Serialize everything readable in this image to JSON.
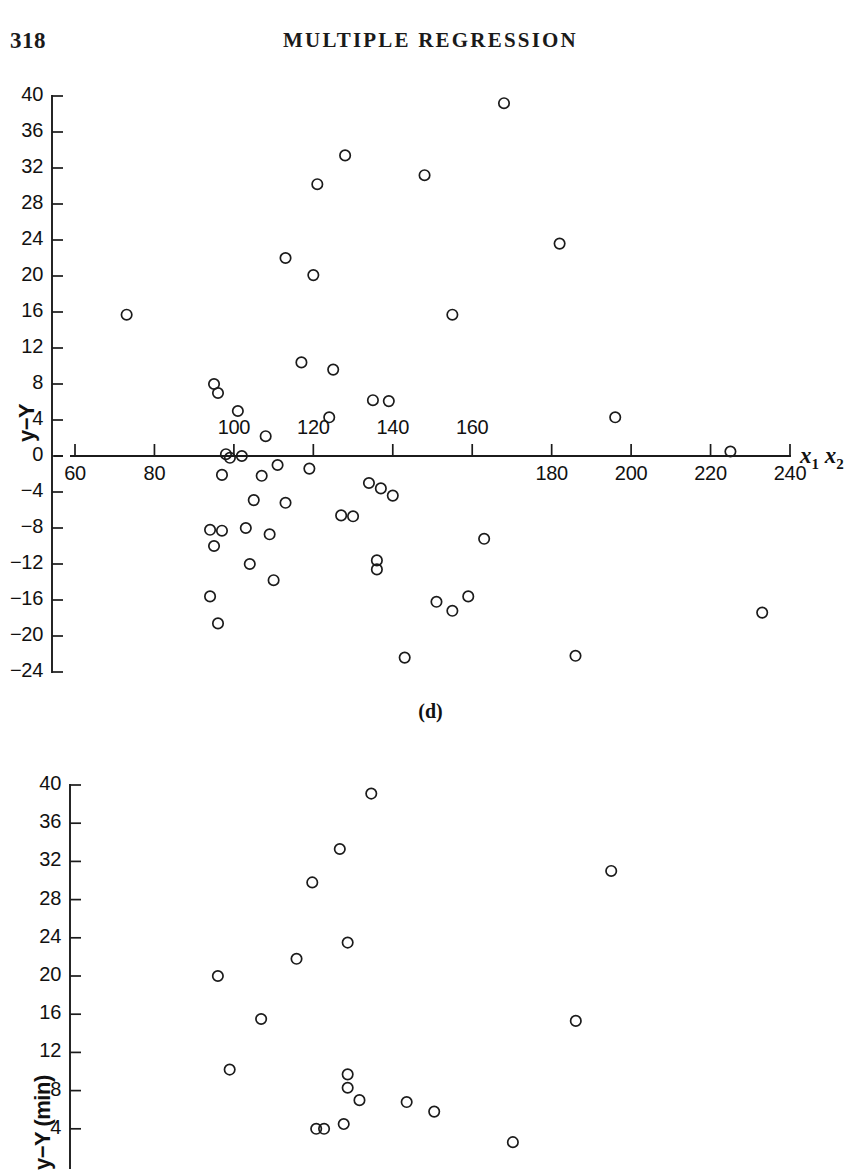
{
  "header": {
    "page_number": "318",
    "running_head": "MULTIPLE REGRESSION"
  },
  "figures": {
    "panel_d_caption": "(d)"
  },
  "chart_data": [
    {
      "id": "panel-d",
      "type": "scatter",
      "title": "",
      "caption": "(d)",
      "xlabel": "x₁x₂",
      "ylabel": "y−Y",
      "xlim": [
        52,
        248
      ],
      "ylim": [
        -24,
        40
      ],
      "grid": false,
      "legend": "none",
      "axis_origin_y": 0,
      "x_ticks": [
        60,
        80,
        100,
        120,
        140,
        160,
        180,
        200,
        220,
        240
      ],
      "x_tick_labels": [
        "60",
        "80",
        "100",
        "120",
        "140",
        "160",
        "180",
        "200",
        "220",
        "240"
      ],
      "x_labels_above_axis": [
        "100",
        "120",
        "140",
        "160"
      ],
      "x_labels_below_axis": [
        "60",
        "80",
        "180",
        "200",
        "220",
        "240"
      ],
      "y_ticks": [
        40,
        36,
        32,
        28,
        24,
        20,
        16,
        12,
        8,
        4,
        0,
        -4,
        -8,
        -12,
        -16,
        -20,
        -24
      ],
      "y_tick_labels": [
        "40",
        "36",
        "32",
        "28",
        "24",
        "20",
        "16",
        "12",
        "8",
        "4",
        "0",
        "−4",
        "−8",
        "−12",
        "−16",
        "−20",
        "−24"
      ],
      "points": [
        [
          168,
          39.2
        ],
        [
          128,
          33.4
        ],
        [
          148,
          31.2
        ],
        [
          121,
          30.2
        ],
        [
          182,
          23.6
        ],
        [
          113,
          22.0
        ],
        [
          120,
          20.1
        ],
        [
          73,
          15.7
        ],
        [
          155,
          15.7
        ],
        [
          117,
          10.4
        ],
        [
          125,
          9.6
        ],
        [
          95,
          8.0
        ],
        [
          96,
          7.0
        ],
        [
          135,
          6.2
        ],
        [
          139,
          6.1
        ],
        [
          101,
          5.0
        ],
        [
          196,
          4.3
        ],
        [
          124,
          4.3
        ],
        [
          108,
          2.2
        ],
        [
          225,
          0.5
        ],
        [
          98,
          0.2
        ],
        [
          102,
          0.0
        ],
        [
          99,
          -0.2
        ],
        [
          111,
          -1.0
        ],
        [
          119,
          -1.4
        ],
        [
          97,
          -2.1
        ],
        [
          107,
          -2.2
        ],
        [
          134,
          -3.0
        ],
        [
          137,
          -3.6
        ],
        [
          140,
          -4.4
        ],
        [
          105,
          -4.9
        ],
        [
          113,
          -5.2
        ],
        [
          127,
          -6.6
        ],
        [
          130,
          -6.7
        ],
        [
          103,
          -8.0
        ],
        [
          94,
          -8.2
        ],
        [
          97,
          -8.3
        ],
        [
          109,
          -8.7
        ],
        [
          95,
          -10.0
        ],
        [
          163,
          -9.2
        ],
        [
          104,
          -12.0
        ],
        [
          136,
          -11.6
        ],
        [
          136,
          -12.6
        ],
        [
          110,
          -13.8
        ],
        [
          94,
          -15.6
        ],
        [
          151,
          -16.2
        ],
        [
          159,
          -15.6
        ],
        [
          233,
          -17.4
        ],
        [
          96,
          -18.6
        ],
        [
          155,
          -17.2
        ],
        [
          143,
          -22.4
        ],
        [
          186,
          -22.2
        ]
      ]
    },
    {
      "id": "panel-e",
      "type": "scatter",
      "title": "",
      "caption": "",
      "xlabel": "",
      "ylabel": "y−Y (min)",
      "xlim": [
        52,
        248
      ],
      "ylim": [
        2,
        40
      ],
      "grid": false,
      "legend": "none",
      "y_ticks": [
        40,
        36,
        32,
        28,
        24,
        20,
        16,
        12,
        8,
        4
      ],
      "y_tick_labels": [
        "40",
        "36",
        "32",
        "28",
        "24",
        "20",
        "16",
        "12",
        "8",
        "4"
      ],
      "points": [
        [
          131,
          39.1
        ],
        [
          123,
          33.3
        ],
        [
          116,
          29.8
        ],
        [
          125,
          23.5
        ],
        [
          112,
          21.8
        ],
        [
          192,
          31.0
        ],
        [
          92,
          20.0
        ],
        [
          103,
          15.5
        ],
        [
          183,
          15.3
        ],
        [
          95,
          10.2
        ],
        [
          125,
          9.7
        ],
        [
          125,
          8.3
        ],
        [
          128,
          7.0
        ],
        [
          140,
          6.8
        ],
        [
          147,
          5.8
        ],
        [
          124,
          4.5
        ],
        [
          117,
          4.0
        ],
        [
          119,
          4.0
        ],
        [
          167,
          2.6
        ]
      ]
    }
  ]
}
